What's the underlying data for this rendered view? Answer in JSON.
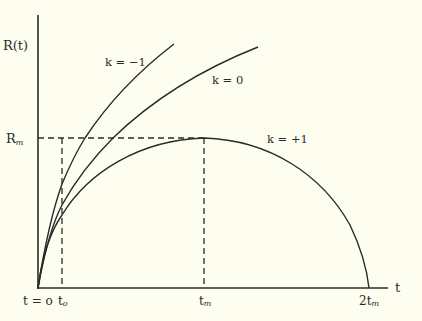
{
  "diagram": {
    "title": "",
    "axes": {
      "y_label": "R(t)",
      "x_label": "t",
      "y_ticks": [
        {
          "label": "R",
          "sub": "m"
        }
      ],
      "x_ticks": [
        {
          "label": "t = o",
          "sub": ""
        },
        {
          "label": "t",
          "sub": "o"
        },
        {
          "label": "t",
          "sub": "m"
        },
        {
          "label": "2t",
          "sub": "m"
        }
      ]
    },
    "curves": [
      {
        "label": "k = −1",
        "description": "open, grows fastest"
      },
      {
        "label": "k = 0",
        "description": "flat, grows monotonically"
      },
      {
        "label": "k = +1",
        "description": "closed, reaches R_m at t_m and recollapses at 2t_m"
      }
    ],
    "reference_lines": [
      {
        "name": "Rm horizontal dashed",
        "from": "y-axis",
        "to": "t_m"
      },
      {
        "name": "t0 vertical dashed",
        "at": "t_o"
      },
      {
        "name": "tm vertical dashed",
        "at": "t_m"
      }
    ],
    "colors": {
      "background": "#fdfdf0",
      "ink": "#2a2a2a"
    }
  }
}
